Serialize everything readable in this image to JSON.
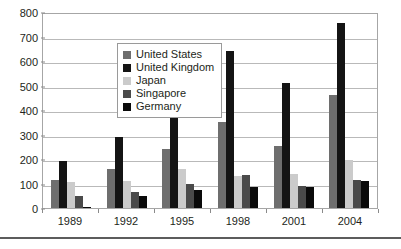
{
  "chart_data": {
    "type": "bar",
    "title": "",
    "subtitle": "",
    "xlabel": "",
    "ylabel": "",
    "categories": [
      "1989",
      "1992",
      "1995",
      "1998",
      "2001",
      "2004"
    ],
    "series": [
      {
        "name": "United States",
        "color": "#6e6e6e",
        "values": [
          115,
          160,
          240,
          350,
          255,
          460
        ]
      },
      {
        "name": "United Kingdom",
        "color": "#141414",
        "values": [
          190,
          290,
          470,
          640,
          510,
          755
        ]
      },
      {
        "name": "Japan",
        "color": "#cbcbcb",
        "values": [
          105,
          110,
          160,
          130,
          140,
          195
        ]
      },
      {
        "name": "Singapore",
        "color": "#4a4a4a",
        "values": [
          50,
          65,
          100,
          135,
          90,
          115
        ]
      },
      {
        "name": "Germany",
        "color": "#0a0a0a",
        "values": [
          5,
          50,
          75,
          85,
          85,
          110
        ]
      }
    ],
    "ylim": [
      0,
      800
    ],
    "ytick_step": 100,
    "yticks": [
      "800",
      "700",
      "600",
      "500",
      "400",
      "300",
      "200",
      "100",
      "0"
    ],
    "grid": "horizontal",
    "legend_position": "upper-left-inside",
    "plot_border_color": "#a6a6a6",
    "gridline_color": "#b9b9b9",
    "background_color": "#ffffff",
    "text_color": "#231f20"
  }
}
